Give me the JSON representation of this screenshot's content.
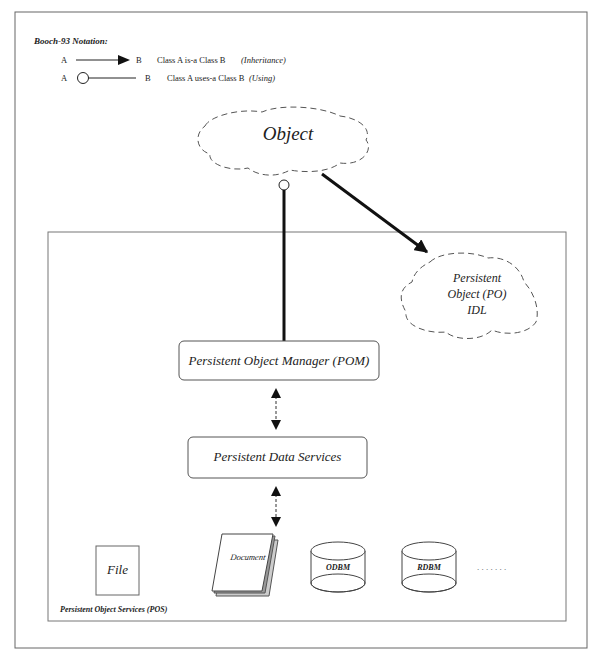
{
  "notation": {
    "title": "Booch-93 Notation:",
    "inheritance": {
      "a": "A",
      "b": "B",
      "description": "Class A  is-a  Class B",
      "kind": "(Inheritance)"
    },
    "using": {
      "a": "A",
      "b": "B",
      "description": "Class A  uses-a  Class B",
      "kind": "(Using)"
    }
  },
  "nodes": {
    "object": "Object",
    "po_idl": [
      "Persistent",
      "Object (PO)",
      "IDL"
    ],
    "pom": "Persistent Object Manager (POM)",
    "pds": "Persistent Data Services",
    "file": "File",
    "document": "Document",
    "odbm": "ODBM",
    "rdbm": "RDBM",
    "ellipsis": ". . . . . . ."
  },
  "container": {
    "label": "Persistent Object Services (POS)"
  },
  "colors": {
    "line": "#222222",
    "frame": "#666666",
    "dash": "#555555"
  }
}
